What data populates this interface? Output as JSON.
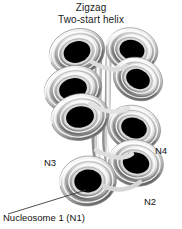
{
  "figure": {
    "title_line_1": "Zigzag",
    "title_line_2": "Two-start helix",
    "background_color": "#ffffff",
    "text_color": "#111111"
  },
  "labels": {
    "n1": "Nucleosome 1 (N1)",
    "n2": "N2",
    "n3": "N3",
    "n4": "N4"
  },
  "diagram": {
    "type": "chromatin-fiber-zigzag-two-start-helix",
    "nucleosome_count": 8,
    "nucleosome_core_color": "#000000",
    "nucleosome_coil_light": "#f2f2f2",
    "nucleosome_coil_mid": "#b9b9b9",
    "nucleosome_coil_dark": "#6e6e6e",
    "linker_dna_color": "#d5d5d5",
    "leader_line_color": "#3a3a3a",
    "nucleosomes": [
      {
        "id": "top-left",
        "cx": 78,
        "cy": 52,
        "rx": 28,
        "ry": 23,
        "rot": -18,
        "column": "left"
      },
      {
        "id": "top-right",
        "cx": 132,
        "cy": 50,
        "rx": 26,
        "ry": 22,
        "rot": 14,
        "column": "right"
      },
      {
        "id": "upper-right",
        "cx": 138,
        "cy": 78,
        "rx": 25,
        "ry": 21,
        "rot": 22,
        "column": "right"
      },
      {
        "id": "upper-left",
        "cx": 74,
        "cy": 88,
        "rx": 29,
        "ry": 23,
        "rot": -14,
        "column": "left"
      },
      {
        "id": "mid-left",
        "cx": 80,
        "cy": 116,
        "rx": 29,
        "ry": 23,
        "rot": -10,
        "column": "left"
      },
      {
        "id": "mid-right",
        "cx": 134,
        "cy": 128,
        "rx": 27,
        "ry": 22,
        "rot": 18,
        "column": "right"
      },
      {
        "id": "lower-right",
        "cx": 136,
        "cy": 163,
        "rx": 27,
        "ry": 23,
        "rot": 14,
        "column": "right"
      },
      {
        "id": "bottom-left",
        "cx": 88,
        "cy": 180,
        "rx": 28,
        "ry": 25,
        "rot": -6,
        "column": "left"
      }
    ],
    "leader_line": {
      "x1": 8,
      "y1": 214,
      "x2": 86,
      "y2": 190
    }
  }
}
